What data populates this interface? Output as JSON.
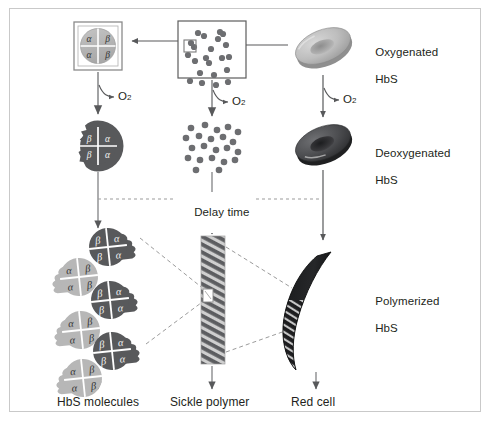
{
  "figure": {
    "type": "biological-process-diagram",
    "background": "#ffffff",
    "border_color": "#c9c9c9"
  },
  "colors": {
    "oxygenated_fill": "#b7b7b7",
    "oxygenated_stroke": "#8f8f8f",
    "deoxygenated_fill": "#58595b",
    "deoxygenated_stroke": "#3f4042",
    "dot_color": "#6d6e71",
    "box_stroke": "#7a7a7a",
    "arrow_color": "#58595b",
    "dashed_color": "#9b9b9b",
    "text_color": "#231f20",
    "polymer_dark": "#58595b",
    "polymer_light": "#d9d9d9",
    "red_cell_dark": "#231f20"
  },
  "labels": {
    "oxygenated_hbs": "Oxygenated\nHbS",
    "oxygenated_hbs_line1": "Oxygenated",
    "oxygenated_hbs_line2": "HbS",
    "deoxygenated_hbs_line1": "Deoxygenated",
    "deoxygenated_hbs_line2": "HbS",
    "polymerized_hbs_line1": "Polymerized",
    "polymerized_hbs_line2": "HbS",
    "delay_time": "Delay time",
    "hbs_molecules": "HbS molecules",
    "sickle_polymer": "Sickle polymer",
    "red_cell": "Red cell",
    "o2": "O",
    "o2_subscript": "2"
  },
  "subunits": {
    "alpha": "α",
    "beta": "β",
    "oxygenated_tetramer_quadrants": [
      {
        "position": "top-left",
        "label": "α"
      },
      {
        "position": "top-right",
        "label": "β"
      },
      {
        "position": "bottom-left",
        "label": "α"
      },
      {
        "position": "bottom-right",
        "label": "β"
      }
    ],
    "deoxygenated_tetramer_quadrants": [
      {
        "position": "top-left",
        "label": "β"
      },
      {
        "position": "top-right",
        "label": "α"
      },
      {
        "position": "bottom-left",
        "label": "β"
      },
      {
        "position": "bottom-right",
        "label": "α"
      }
    ]
  },
  "columns": [
    {
      "name": "tetramer-column",
      "top_item": "oxygenated-tetramer-box",
      "mid_item": "deoxygenated-tetramer",
      "bottom_item": "hbs-molecules-chain",
      "bottom_label": "HbS molecules"
    },
    {
      "name": "molecule-cloud-column",
      "top_item": "oxygenated-molecule-box",
      "mid_item": "deoxygenated-molecule-cloud",
      "bottom_item": "sickle-polymer-fiber",
      "bottom_label": "Sickle polymer"
    },
    {
      "name": "cell-column",
      "top_item": "oxygenated-red-cell",
      "mid_item": "deoxygenated-red-cell",
      "bottom_item": "sickled-red-cell",
      "bottom_label": "Red cell"
    }
  ],
  "molecule_cloud_oxygenated": {
    "count": 22,
    "highlighted_index": 6,
    "dots": [
      [
        22,
        11
      ],
      [
        38,
        7
      ],
      [
        12,
        22
      ],
      [
        29,
        24
      ],
      [
        44,
        20
      ],
      [
        13,
        36
      ],
      [
        27,
        38
      ],
      [
        40,
        33
      ],
      [
        6,
        30
      ],
      [
        18,
        48
      ],
      [
        32,
        50
      ],
      [
        45,
        45
      ],
      [
        9,
        18
      ],
      [
        36,
        14
      ],
      [
        24,
        33
      ],
      [
        41,
        9
      ],
      [
        16,
        8
      ],
      [
        47,
        32
      ],
      [
        20,
        58
      ],
      [
        34,
        60
      ],
      [
        46,
        57
      ],
      [
        8,
        56
      ]
    ]
  },
  "molecule_cloud_deoxygenated": {
    "count": 22,
    "dots": [
      [
        8,
        6
      ],
      [
        22,
        3
      ],
      [
        34,
        8
      ],
      [
        45,
        5
      ],
      [
        55,
        10
      ],
      [
        3,
        16
      ],
      [
        16,
        14
      ],
      [
        28,
        17
      ],
      [
        40,
        15
      ],
      [
        50,
        20
      ],
      [
        9,
        26
      ],
      [
        21,
        24
      ],
      [
        33,
        28
      ],
      [
        44,
        26
      ],
      [
        55,
        30
      ],
      [
        5,
        36
      ],
      [
        17,
        38
      ],
      [
        29,
        36
      ],
      [
        41,
        40
      ],
      [
        52,
        38
      ],
      [
        13,
        48
      ],
      [
        36,
        48
      ]
    ]
  },
  "chain_units": [
    {
      "index": 0,
      "tone": "dark",
      "left": "β",
      "right": "α"
    },
    {
      "index": 1,
      "tone": "light",
      "left": "α",
      "right": "β"
    },
    {
      "index": 2,
      "tone": "dark",
      "left": "β",
      "right": "α"
    },
    {
      "index": 3,
      "tone": "light",
      "left": "α",
      "right": "β"
    },
    {
      "index": 4,
      "tone": "dark",
      "left": "β",
      "right": "α"
    },
    {
      "index": 5,
      "tone": "light",
      "left": "α",
      "right": "β"
    }
  ],
  "arrows": {
    "top_right_to_mid": "leftward",
    "top_mid_to_left": "leftward",
    "vertical_down": "downward",
    "o2_release_count": 3
  }
}
